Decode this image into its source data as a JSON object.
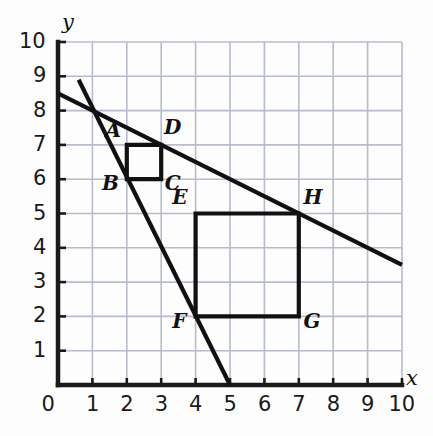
{
  "chart_data": {
    "type": "scatter",
    "title": "",
    "xlabel": "x",
    "ylabel": "y",
    "xlim": [
      0,
      10
    ],
    "ylim": [
      0,
      10
    ],
    "grid": true,
    "legend": "none",
    "x_ticks": [
      "0",
      "1",
      "2",
      "3",
      "4",
      "5",
      "6",
      "7",
      "8",
      "9",
      "10"
    ],
    "y_ticks": [
      "0",
      "1",
      "2",
      "3",
      "4",
      "5",
      "6",
      "7",
      "8",
      "9",
      "10"
    ],
    "x_tick_values": [
      0,
      1,
      2,
      3,
      4,
      5,
      6,
      7,
      8,
      9,
      10
    ],
    "y_tick_values": [
      0,
      1,
      2,
      3,
      4,
      5,
      6,
      7,
      8,
      9,
      10
    ],
    "labeled_points": [
      {
        "name": "A",
        "x": 2,
        "y": 7,
        "label_dx": -0.62,
        "label_dy": 0.42
      },
      {
        "name": "B",
        "x": 2,
        "y": 6,
        "label_dx": -0.72,
        "label_dy": -0.1
      },
      {
        "name": "C",
        "x": 3,
        "y": 6,
        "label_dx": 0.1,
        "label_dy": -0.1
      },
      {
        "name": "D",
        "x": 3,
        "y": 7,
        "label_dx": 0.08,
        "label_dy": 0.52
      },
      {
        "name": "E",
        "x": 4,
        "y": 5,
        "label_dx": -0.68,
        "label_dy": 0.48
      },
      {
        "name": "F",
        "x": 4,
        "y": 2,
        "label_dx": -0.68,
        "label_dy": -0.12
      },
      {
        "name": "G",
        "x": 7,
        "y": 2,
        "label_dx": 0.14,
        "label_dy": -0.12
      },
      {
        "name": "H",
        "x": 7,
        "y": 5,
        "label_dx": 0.14,
        "label_dy": 0.48
      }
    ],
    "squares": [
      {
        "name": "square-ABCD",
        "vertices": [
          {
            "label": "A",
            "x": 2,
            "y": 7
          },
          {
            "label": "D",
            "x": 3,
            "y": 7
          },
          {
            "label": "C",
            "x": 3,
            "y": 6
          },
          {
            "label": "B",
            "x": 2,
            "y": 6
          }
        ],
        "side_length": 1
      },
      {
        "name": "square-EFGH",
        "vertices": [
          {
            "label": "E",
            "x": 4,
            "y": 5
          },
          {
            "label": "H",
            "x": 7,
            "y": 5
          },
          {
            "label": "G",
            "x": 7,
            "y": 2
          },
          {
            "label": "F",
            "x": 4,
            "y": 2
          }
        ],
        "side_length": 3
      }
    ],
    "lines": [
      {
        "name": "shallow-line",
        "from": {
          "x": 0,
          "y": 8.5
        },
        "to": {
          "x": 10,
          "y": 3.5
        },
        "slope": -0.5,
        "intercept": 8.5
      },
      {
        "name": "steep-line",
        "from": {
          "x": 0.6,
          "y": 8.9
        },
        "to": {
          "x": 5,
          "y": 0
        },
        "slope": -2,
        "intercept": 10
      }
    ],
    "colors": {
      "background": "#fdfdfd",
      "grid": "#b6bccb",
      "axis": "#1a1a1a",
      "shape_stroke": "#111111",
      "line_stroke": "#111111",
      "tick_text": "#1a1a1a"
    }
  }
}
